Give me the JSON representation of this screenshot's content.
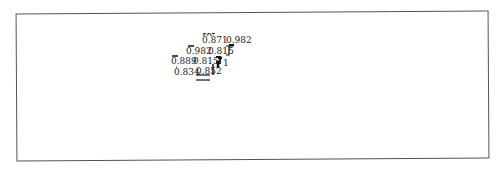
{
  "diagram": {
    "type": "tree-dendrogram",
    "frame_color": "#555555",
    "line_color": "#111111",
    "labels": [
      {
        "id": "n1",
        "text": "0.871",
        "x": 202,
        "y": 36
      },
      {
        "id": "n2",
        "text": "0.982",
        "x": 226,
        "y": 36
      },
      {
        "id": "n3",
        "text": "0.982",
        "x": 186,
        "y": 47
      },
      {
        "id": "n4",
        "text": "0.815",
        "x": 208,
        "y": 47
      },
      {
        "id": "n5",
        "text": "0.889",
        "x": 171,
        "y": 57
      },
      {
        "id": "n6",
        "text": "0.815",
        "x": 193,
        "y": 57
      },
      {
        "id": "n7",
        "text": "1",
        "x": 223,
        "y": 59
      },
      {
        "id": "n8",
        "text": "0.834",
        "x": 174,
        "y": 68
      },
      {
        "id": "n9",
        "text": "0.852",
        "x": 196,
        "y": 67
      }
    ]
  }
}
